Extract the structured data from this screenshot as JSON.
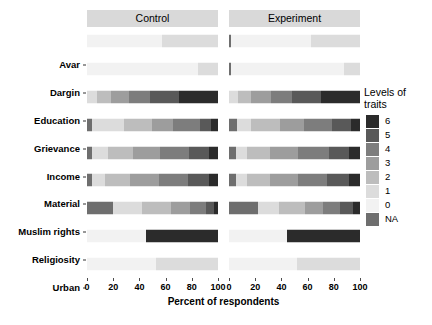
{
  "chart_data": {
    "type": "bar",
    "subtype": "stacked-horizontal-likert",
    "title": "",
    "xlabel": "Percent of respondents",
    "ylabel": "",
    "xlim": [
      0,
      100
    ],
    "xticks": [
      0,
      20,
      40,
      60,
      80,
      100
    ],
    "xticklabels": [
      "0",
      "20",
      "40",
      "60",
      "80",
      "100"
    ],
    "grid": false,
    "facets": [
      "Control",
      "Experiment"
    ],
    "categories": [
      "Avar",
      "Dargin",
      "Education",
      "Grievance",
      "Income",
      "Material",
      "Muslim rights",
      "Religiosity",
      "Urban"
    ],
    "legend": {
      "title": "Levels of traits",
      "title_line1": "Levels of",
      "title_line2": "traits",
      "position": "right",
      "entries": [
        {
          "label": "6",
          "color": "#2b2b2b"
        },
        {
          "label": "5",
          "color": "#595959"
        },
        {
          "label": "4",
          "color": "#7d7d7d"
        },
        {
          "label": "3",
          "color": "#9d9d9d"
        },
        {
          "label": "2",
          "color": "#bdbdbd"
        },
        {
          "label": "1",
          "color": "#dcdcdc"
        },
        {
          "label": "0",
          "color": "#f2f2f2"
        },
        {
          "label": "NA",
          "color": "#6e6e6e"
        }
      ]
    },
    "series": [
      {
        "name": "NA",
        "color": "#6e6e6e",
        "values": {
          "Control": {
            "Avar": 0,
            "Dargin": 0,
            "Education": 0,
            "Grievance": 4,
            "Income": 4,
            "Material": 4,
            "Muslim rights": 20,
            "Religiosity": 0,
            "Urban": 0
          },
          "Experiment": {
            "Avar": 1.5,
            "Dargin": 1.5,
            "Education": 0,
            "Grievance": 6,
            "Income": 5,
            "Material": 5,
            "Muslim rights": 22,
            "Religiosity": 0,
            "Urban": 0
          }
        }
      },
      {
        "name": "0",
        "color": "#f2f2f2",
        "values": {
          "Control": {
            "Avar": 57,
            "Dargin": 85,
            "Education": 0,
            "Grievance": 0,
            "Income": 0,
            "Material": 0,
            "Muslim rights": 0,
            "Religiosity": 45,
            "Urban": 53
          },
          "Experiment": {
            "Avar": 61,
            "Dargin": 86,
            "Education": 0,
            "Grievance": 0,
            "Income": 0,
            "Material": 0,
            "Muslim rights": 0,
            "Religiosity": 44,
            "Urban": 52
          }
        }
      },
      {
        "name": "1",
        "color": "#dcdcdc",
        "values": {
          "Control": {
            "Avar": 43,
            "Dargin": 15,
            "Education": 8,
            "Grievance": 24,
            "Income": 12,
            "Material": 10,
            "Muslim rights": 22,
            "Religiosity": 0,
            "Urban": 47
          },
          "Experiment": {
            "Avar": 37.5,
            "Dargin": 12.5,
            "Education": 7,
            "Grievance": 11,
            "Income": 9,
            "Material": 9,
            "Muslim rights": 16,
            "Religiosity": 0,
            "Urban": 48
          }
        }
      },
      {
        "name": "2",
        "color": "#bdbdbd",
        "values": {
          "Control": {
            "Avar": 0,
            "Dargin": 0,
            "Education": 10,
            "Grievance": 22,
            "Income": 19,
            "Material": 19,
            "Muslim rights": 22,
            "Religiosity": 0,
            "Urban": 0
          },
          "Experiment": {
            "Avar": 0,
            "Dargin": 0,
            "Education": 10,
            "Grievance": 22,
            "Income": 17,
            "Material": 17,
            "Muslim rights": 20,
            "Religiosity": 0,
            "Urban": 0
          }
        }
      },
      {
        "name": "3",
        "color": "#9d9d9d",
        "values": {
          "Control": {
            "Avar": 0,
            "Dargin": 0,
            "Education": 14,
            "Grievance": 16,
            "Income": 21,
            "Material": 22,
            "Muslim rights": 15,
            "Religiosity": 0,
            "Urban": 0
          },
          "Experiment": {
            "Avar": 0,
            "Dargin": 0,
            "Education": 15,
            "Grievance": 18,
            "Income": 22,
            "Material": 22,
            "Muslim rights": 14,
            "Religiosity": 0,
            "Urban": 0
          }
        }
      },
      {
        "name": "4",
        "color": "#7d7d7d",
        "values": {
          "Control": {
            "Avar": 0,
            "Dargin": 0,
            "Education": 16,
            "Grievance": 20,
            "Income": 22,
            "Material": 22,
            "Muslim rights": 12,
            "Religiosity": 0,
            "Urban": 0
          },
          "Experiment": {
            "Avar": 0,
            "Dargin": 0,
            "Education": 16,
            "Grievance": 22,
            "Income": 23,
            "Material": 22,
            "Muslim rights": 13,
            "Religiosity": 0,
            "Urban": 0
          }
        }
      },
      {
        "name": "5",
        "color": "#595959",
        "values": {
          "Control": {
            "Avar": 0,
            "Dargin": 0,
            "Education": 22,
            "Grievance": 9,
            "Income": 15,
            "Material": 16,
            "Muslim rights": 6,
            "Religiosity": 0,
            "Urban": 0
          },
          "Experiment": {
            "Avar": 0,
            "Dargin": 0,
            "Education": 22,
            "Grievance": 14,
            "Income": 16,
            "Material": 17,
            "Muslim rights": 10,
            "Religiosity": 0,
            "Urban": 0
          }
        }
      },
      {
        "name": "6",
        "color": "#2b2b2b",
        "values": {
          "Control": {
            "Avar": 0,
            "Dargin": 0,
            "Education": 30,
            "Grievance": 5,
            "Income": 7,
            "Material": 7,
            "Muslim rights": 3,
            "Religiosity": 55,
            "Urban": 0
          },
          "Experiment": {
            "Avar": 0,
            "Dargin": 0,
            "Education": 30,
            "Grievance": 7,
            "Income": 8,
            "Material": 8,
            "Muslim rights": 5,
            "Religiosity": 56,
            "Urban": 0
          }
        }
      }
    ]
  },
  "axis": {
    "x_title": "Percent of respondents"
  }
}
